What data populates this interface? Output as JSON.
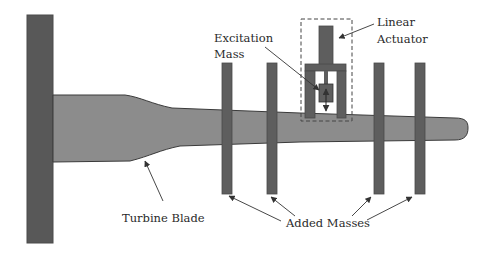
{
  "diagram": {
    "type": "schematic",
    "labels": {
      "linear_actuator_line1": "Linear",
      "linear_actuator_line2": "Actuator",
      "excitation_mass_line1": "Excitation",
      "excitation_mass_line2": "Mass",
      "turbine_blade": "Turbine Blade",
      "added_masses": "Added Masses"
    },
    "components": {
      "fixed_wall": {
        "count": 1
      },
      "turbine_blade": {
        "count": 1
      },
      "added_masses": {
        "count": 4
      },
      "linear_actuator": {
        "count": 1,
        "enclosed_in_dashed_box": true
      },
      "excitation_mass": {
        "count": 1,
        "motion": "vertical (double-headed arrow)"
      }
    },
    "colors": {
      "wall": "#585858",
      "blade_fill": "#8c8c8c",
      "mass_fill": "#5e5e5e",
      "outline": "#3a3a3a",
      "text": "#2a2a2a"
    }
  }
}
